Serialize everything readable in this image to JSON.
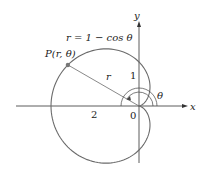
{
  "diagram": {
    "type": "polar-curve",
    "equation_label": "r = 1 − cos θ",
    "point_label": "P(r, θ)",
    "radius_label": "r",
    "angle_label": "θ",
    "axis_x_label": "x",
    "axis_y_label": "y",
    "tick_labels": {
      "x_neg": "2",
      "y_pos": "1",
      "origin": "0"
    },
    "colors": {
      "curve": "#6b6b6b",
      "axis": "#333333",
      "point": "#777777"
    }
  }
}
